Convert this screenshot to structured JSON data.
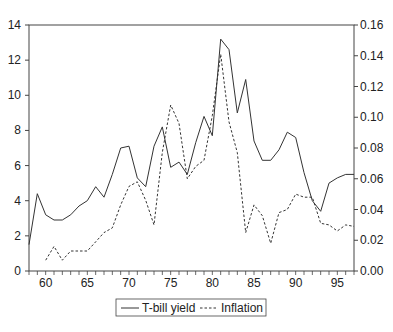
{
  "chart_data": {
    "type": "line",
    "title": "",
    "xlabel": "",
    "ylabel": "",
    "y2label": "",
    "xlim": [
      58,
      97
    ],
    "ylim": [
      0,
      14
    ],
    "y2lim": [
      0,
      0.16
    ],
    "grid": false,
    "legend_position": "bottom",
    "x_ticks": [
      60,
      65,
      70,
      75,
      80,
      85,
      90,
      95
    ],
    "y_ticks": [
      0,
      2,
      4,
      6,
      8,
      10,
      12,
      14
    ],
    "y2_ticks": [
      "0.00",
      "0.02",
      "0.04",
      "0.06",
      "0.08",
      "0.10",
      "0.12",
      "0.14",
      "0.16"
    ],
    "series": [
      {
        "name": "T-bill yield",
        "axis": "left",
        "style": "solid",
        "x": [
          58,
          59,
          60,
          61,
          62,
          63,
          64,
          65,
          66,
          67,
          68,
          69,
          70,
          71,
          72,
          73,
          74,
          75,
          76,
          77,
          78,
          79,
          80,
          81,
          82,
          83,
          84,
          85,
          86,
          87,
          88,
          89,
          90,
          91,
          92,
          93,
          94,
          95,
          96,
          97
        ],
        "values": [
          1.5,
          4.4,
          3.2,
          2.9,
          2.9,
          3.2,
          3.7,
          4.0,
          4.8,
          4.2,
          5.5,
          7.0,
          7.1,
          5.3,
          4.8,
          7.1,
          8.2,
          5.9,
          6.2,
          5.5,
          7.3,
          8.8,
          7.7,
          13.2,
          12.6,
          9.0,
          10.9,
          7.4,
          6.3,
          6.3,
          6.9,
          7.9,
          7.6,
          5.6,
          4.0,
          3.4,
          5.0,
          5.3,
          5.5,
          5.5
        ]
      },
      {
        "name": "Inflation",
        "axis": "right",
        "style": "dashed",
        "x": [
          60,
          61,
          62,
          63,
          64,
          65,
          66,
          67,
          68,
          69,
          70,
          71,
          72,
          73,
          74,
          75,
          76,
          77,
          78,
          79,
          80,
          81,
          82,
          83,
          84,
          85,
          86,
          87,
          88,
          89,
          90,
          91,
          92,
          93,
          94,
          95,
          96,
          97
        ],
        "values": [
          0.007,
          0.016,
          0.007,
          0.013,
          0.013,
          0.013,
          0.019,
          0.025,
          0.028,
          0.043,
          0.055,
          0.058,
          0.046,
          0.03,
          0.077,
          0.108,
          0.096,
          0.06,
          0.068,
          0.072,
          0.101,
          0.141,
          0.097,
          0.077,
          0.025,
          0.043,
          0.036,
          0.018,
          0.038,
          0.04,
          0.05,
          0.048,
          0.048,
          0.031,
          0.03,
          0.026,
          0.03,
          0.029
        ]
      }
    ]
  },
  "legend": {
    "items": [
      {
        "label": "T-bill yield",
        "style": "solid"
      },
      {
        "label": "Inflation",
        "style": "dashed"
      }
    ]
  },
  "colors": {
    "line": "#333333",
    "axis": "#444444",
    "background": "#ffffff"
  }
}
